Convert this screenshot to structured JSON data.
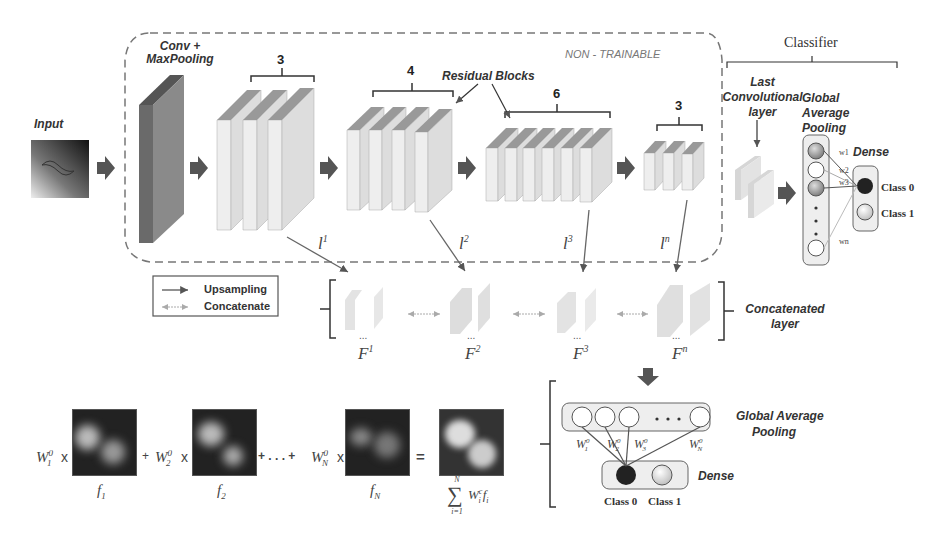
{
  "top": {
    "input_label": "Input",
    "conv_label_line1": "Conv +",
    "conv_label_line2": "MaxPooling",
    "non_trainable_label": "NON - TRAINABLE",
    "residual_blocks_label": "Residual Blocks",
    "stage_counts": [
      "3",
      "4",
      "6",
      "3"
    ],
    "layer_labels": [
      "l",
      "l",
      "l",
      "l"
    ],
    "layer_superscripts": [
      "1",
      "2",
      "3",
      "n"
    ]
  },
  "classifier": {
    "title": "Classifier",
    "last_conv_line1": "Last",
    "last_conv_line2": "Convolutional",
    "last_conv_line3": "layer",
    "gap_line1": "Global",
    "gap_line2": "Average",
    "gap_line3": "Pooling",
    "dense_label": "Dense",
    "weights": [
      "w1",
      "w2",
      "w3",
      "wn"
    ],
    "class0": "Class 0",
    "class1": "Class 1"
  },
  "legend": {
    "upsampling": "Upsampling",
    "concatenate": "Concatenate"
  },
  "concat": {
    "label_line1": "Concatenated",
    "label_line2": "layer",
    "feature_labels": [
      "F",
      "F",
      "F",
      "F"
    ],
    "feature_superscripts": [
      "1",
      "2",
      "3",
      "n"
    ],
    "ellipsis": "..."
  },
  "cam": {
    "terms": [
      {
        "weight": "W",
        "sub": "1",
        "sup": "0",
        "feature": "f",
        "fsub": "1"
      },
      {
        "weight": "W",
        "sub": "2",
        "sup": "0",
        "feature": "f",
        "fsub": "2"
      },
      {
        "weight": "W",
        "sub": "N",
        "sup": "0",
        "feature": "f",
        "fsub": "N"
      }
    ],
    "times": "x",
    "plus": "+",
    "dots_plus": "+ . . . +",
    "equals": "=",
    "sum_top": "N",
    "sum_bottom": "i=1",
    "sum_expr": "W",
    "sum_expr_sub": "i",
    "sum_expr_sup": "c",
    "sum_expr_feature": "f",
    "sum_expr_feature_sub": "i"
  },
  "bottom_classifier": {
    "gap_line1": "Global Average",
    "gap_line2": "Pooling",
    "dense_label": "Dense",
    "weights": [
      {
        "w": "W",
        "sub": "1",
        "sup": "0"
      },
      {
        "w": "W",
        "sub": "2",
        "sup": "0"
      },
      {
        "w": "W",
        "sub": "3",
        "sup": "0"
      },
      {
        "w": "W",
        "sub": "N",
        "sup": "0"
      }
    ],
    "dots": "• • •",
    "class0": "Class 0",
    "class1": "Class 1"
  },
  "colors": {
    "dark_arrow": "#555555",
    "block_face": "#e6e6e6",
    "block_top": "#8a8a8a",
    "conv_block": "#6e6e6e",
    "dashed_border": "#777777"
  }
}
